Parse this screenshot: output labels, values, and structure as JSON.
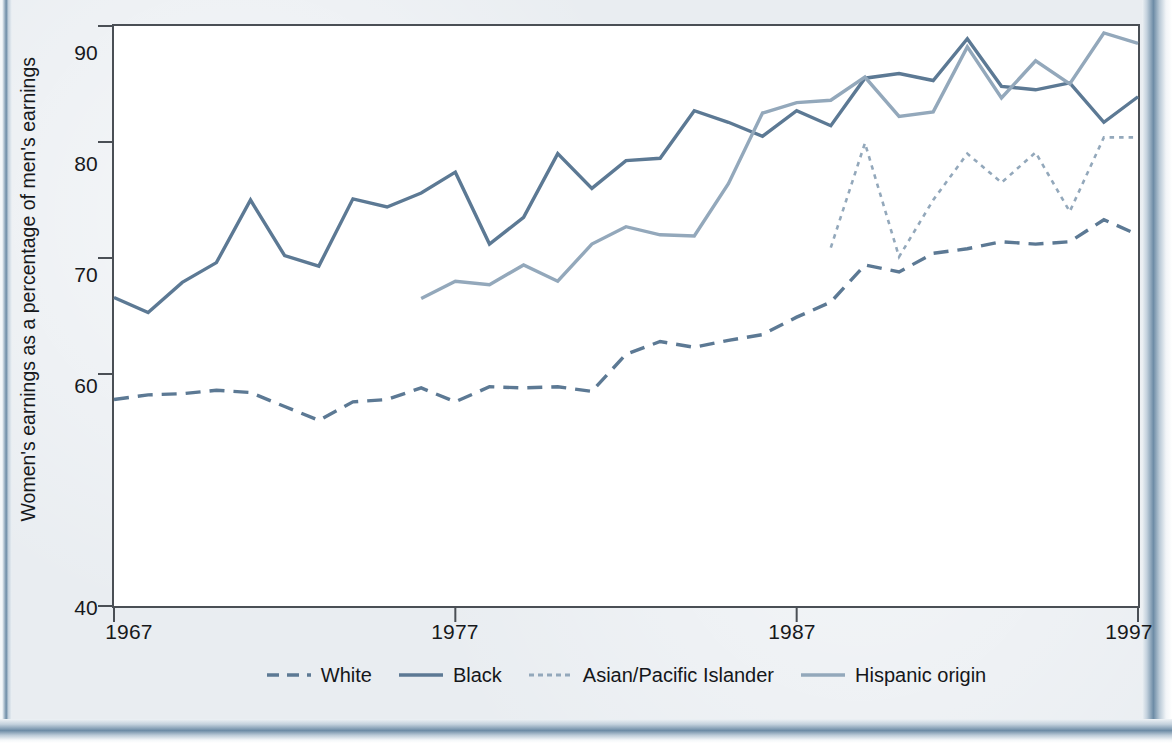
{
  "figure": {
    "ylabel": "Women's earnings as a percentage of men's earnings",
    "frame_color": "#4a4f55",
    "page_accent_color": "#6d8ca6",
    "page_background": "#e9edf1"
  },
  "axes": {
    "y_ticks": [
      "40",
      "60",
      "70",
      "80",
      "90"
    ],
    "x_ticks": [
      "1967",
      "1977",
      "1987",
      "1997"
    ]
  },
  "legend": {
    "items": [
      {
        "label": "White",
        "style": "dashed",
        "color": "#5c7994",
        "swatch": "dashed-line-swatch"
      },
      {
        "label": "Black",
        "style": "solid",
        "color": "#5c7994",
        "swatch": "solid-line-swatch"
      },
      {
        "label": "Asian/Pacific Islander",
        "style": "dotted",
        "color": "#93a8bb",
        "swatch": "dotted-line-swatch"
      },
      {
        "label": "Hispanic origin",
        "style": "solid",
        "color": "#93a8bb",
        "swatch": "solid-line-swatch"
      }
    ]
  },
  "chart_data": {
    "type": "line",
    "title": "",
    "xlabel": "",
    "ylabel": "Women's earnings as a percentage of men's earnings",
    "xlim": [
      1967,
      1997
    ],
    "ylim": [
      40,
      90
    ],
    "y_ticks": [
      40,
      60,
      70,
      80,
      90
    ],
    "x_ticks": [
      1967,
      1977,
      1987,
      1997
    ],
    "grid": false,
    "legend_position": "bottom",
    "x": [
      1967,
      1968,
      1969,
      1970,
      1971,
      1972,
      1973,
      1974,
      1975,
      1976,
      1977,
      1978,
      1979,
      1980,
      1981,
      1982,
      1983,
      1984,
      1985,
      1986,
      1987,
      1988,
      1989,
      1990,
      1991,
      1992,
      1993,
      1994,
      1995,
      1996,
      1997
    ],
    "series": [
      {
        "name": "White",
        "style": "dashed",
        "color": "#5c7994",
        "x": [
          1967,
          1968,
          1969,
          1970,
          1971,
          1972,
          1973,
          1974,
          1975,
          1976,
          1977,
          1978,
          1979,
          1980,
          1981,
          1982,
          1983,
          1984,
          1985,
          1986,
          1987,
          1988,
          1989,
          1990,
          1991,
          1992,
          1993,
          1994,
          1995,
          1996,
          1997
        ],
        "values": [
          57.8,
          58.2,
          58.3,
          58.6,
          58.4,
          57.2,
          56.0,
          57.6,
          57.8,
          58.8,
          57.6,
          58.9,
          58.8,
          58.9,
          58.5,
          61.7,
          62.8,
          62.3,
          62.9,
          63.4,
          64.9,
          66.2,
          69.4,
          68.8,
          70.4,
          70.8,
          71.4,
          71.2,
          71.4,
          73.3,
          72.0
        ]
      },
      {
        "name": "Black",
        "style": "solid",
        "color": "#5c7994",
        "x": [
          1967,
          1968,
          1969,
          1970,
          1971,
          1972,
          1973,
          1974,
          1975,
          1976,
          1977,
          1978,
          1979,
          1980,
          1981,
          1982,
          1983,
          1984,
          1985,
          1986,
          1987,
          1988,
          1989,
          1990,
          1991,
          1992,
          1993,
          1994,
          1995,
          1996,
          1997
        ],
        "values": [
          66.6,
          65.3,
          67.9,
          69.6,
          75.0,
          70.2,
          69.3,
          75.1,
          74.4,
          75.6,
          77.4,
          71.2,
          73.5,
          79.0,
          76.0,
          78.4,
          78.6,
          82.7,
          81.7,
          80.5,
          82.7,
          81.4,
          85.5,
          85.9,
          85.3,
          88.9,
          84.8,
          84.5,
          85.1,
          81.7,
          83.9
        ]
      },
      {
        "name": "Asian/Pacific Islander",
        "style": "dotted",
        "color": "#93a8bb",
        "x": [
          1988,
          1989,
          1990,
          1991,
          1992,
          1993,
          1994,
          1995,
          1996,
          1997
        ],
        "values": [
          70.9,
          79.9,
          70.1,
          75.0,
          79.0,
          76.5,
          79.1,
          74.0,
          80.4,
          80.4
        ]
      },
      {
        "name": "Hispanic origin",
        "style": "solid",
        "color": "#93a8bb",
        "x": [
          1976,
          1977,
          1978,
          1979,
          1980,
          1981,
          1982,
          1983,
          1984,
          1985,
          1986,
          1987,
          1988,
          1989,
          1990,
          1991,
          1992,
          1993,
          1994,
          1995,
          1996,
          1997
        ],
        "values": [
          66.5,
          68.0,
          67.7,
          69.4,
          68.0,
          71.2,
          72.7,
          72.0,
          71.9,
          76.4,
          82.5,
          83.4,
          83.6,
          85.6,
          82.2,
          82.6,
          88.2,
          83.8,
          87.0,
          85.0,
          89.4,
          88.5
        ]
      }
    ]
  }
}
